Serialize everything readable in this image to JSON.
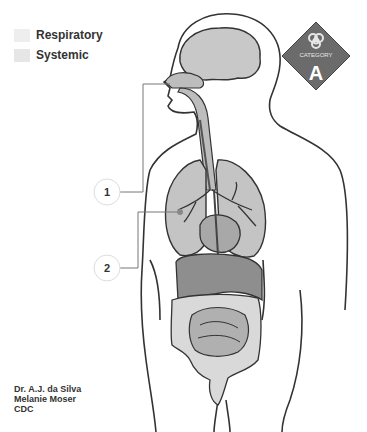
{
  "legend": {
    "items": [
      {
        "label": "Respiratory",
        "color": "#eeeeee"
      },
      {
        "label": "Systemic",
        "color": "#e6e6e6"
      }
    ]
  },
  "badge": {
    "top_text": "CATEGORY",
    "letter": "A",
    "icon": "biohazard-icon",
    "color": "#6b6b6b"
  },
  "callouts": [
    {
      "number": "1"
    },
    {
      "number": "2"
    }
  ],
  "credits": {
    "line1": "Dr. A.J. da Silva",
    "line2": "Melanie Moser",
    "line3": "CDC"
  }
}
